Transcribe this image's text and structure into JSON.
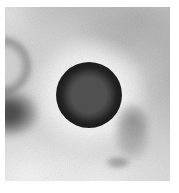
{
  "photo": {
    "alt": "Grayscale micrograph: dark circular vesicle with bright halo, partial ring at left edge, dark blob mid-left, faint blob lower right, mottled grainy background"
  },
  "colors": {
    "page_background": "#ffffff",
    "photo_base": "#d4d4d4",
    "vesicle_core": "#525252",
    "vesicle_ring": "#1e1e1e",
    "halo": "#f7f7f7",
    "blob_dark": "#3f3f3f",
    "blob_faint": "#8e8e8e",
    "partial_ring": "#787878"
  }
}
